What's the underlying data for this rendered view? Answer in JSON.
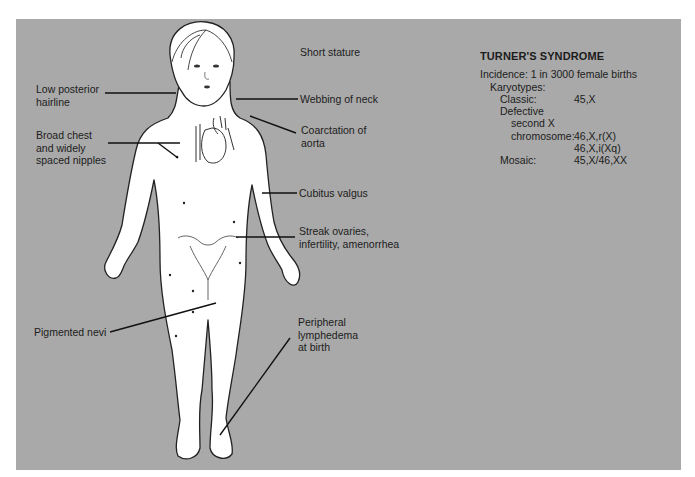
{
  "panel": {
    "background": "#a9a9a9"
  },
  "labels": {
    "short_stature": "Short stature",
    "low_posterior_hairline": "Low posterior\nhairline",
    "webbing_of_neck": "Webbing of neck",
    "broad_chest": "Broad chest\nand widely\nspaced nipples",
    "coarctation": "Coarctation of\naorta",
    "cubitus_valgus": "Cubitus valgus",
    "streak_ovaries": "Streak ovaries,\ninfertility, amenorrhea",
    "pigmented_nevi": "Pigmented nevi",
    "lymphedema": "Peripheral\nlymphedema\nat birth"
  },
  "info": {
    "title": "TURNER'S SYNDROME",
    "incidence": "Incidence: 1 in 3000 female births",
    "karyotypes_heading": "Karyotypes:",
    "rows": [
      {
        "key": "Classic:",
        "value": "45,X",
        "indent": 1
      },
      {
        "key": "Defective",
        "value": "",
        "indent": 1
      },
      {
        "key": "second X",
        "value": "",
        "indent": 2
      },
      {
        "key": "chromosome:",
        "value": "46,X,r(X)",
        "indent": 2
      },
      {
        "key": "",
        "value": "46,X,i(Xq)",
        "indent": 2
      },
      {
        "key": "Mosaic:",
        "value": "45,X/46,XX",
        "indent": 1
      }
    ]
  }
}
